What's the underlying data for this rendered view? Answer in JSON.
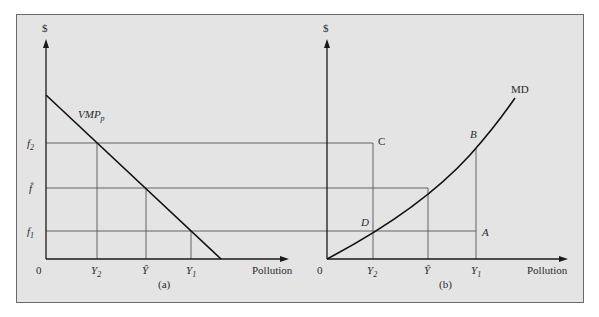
{
  "frame": {
    "background": "#e4e4e4",
    "border_color": "#6a6a6a"
  },
  "panel_a": {
    "caption": "(a)",
    "y_axis_label": "$",
    "x_axis_label": "Pollution",
    "origin_label": "0",
    "curve_label_main": "VMP",
    "curve_label_sub": "p",
    "y_ticks": [
      {
        "main": "f",
        "sub": "2"
      },
      {
        "main": "f̂",
        "sub": ""
      },
      {
        "main": "f",
        "sub": "1"
      }
    ],
    "x_ticks": [
      {
        "main": "Y",
        "sub": "2"
      },
      {
        "main": "Ŷ",
        "sub": ""
      },
      {
        "main": "Y",
        "sub": "1"
      }
    ]
  },
  "panel_b": {
    "caption": "(b)",
    "y_axis_label": "$",
    "x_axis_label": "Pollution",
    "origin_label": "0",
    "curve_label": "MD",
    "points": {
      "A": "A",
      "B": "B",
      "C": "C",
      "D": "D"
    },
    "x_ticks": [
      {
        "main": "Y",
        "sub": "2"
      },
      {
        "main": "Ŷ",
        "sub": ""
      },
      {
        "main": "Y",
        "sub": "1"
      }
    ]
  }
}
